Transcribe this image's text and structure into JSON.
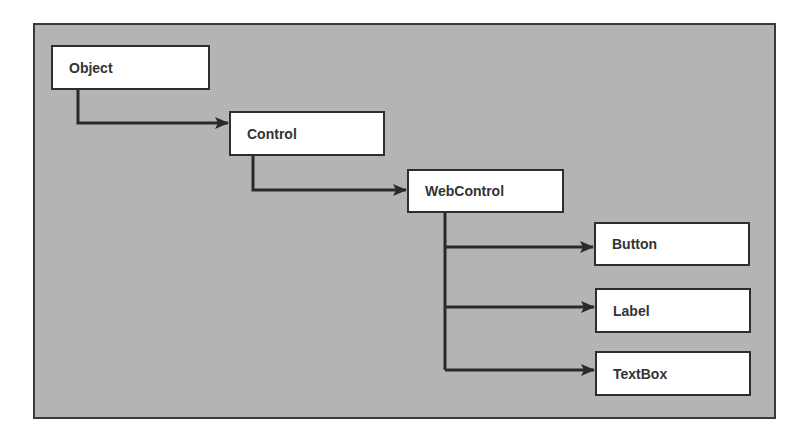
{
  "diagram": {
    "type": "class-hierarchy",
    "background_color": "#b4b4b4",
    "border_color": "#3a3a3a",
    "nodes": [
      {
        "id": "object",
        "label": "Object"
      },
      {
        "id": "control",
        "label": "Control"
      },
      {
        "id": "webcontrol",
        "label": "WebControl"
      },
      {
        "id": "button",
        "label": "Button"
      },
      {
        "id": "label",
        "label": "Label"
      },
      {
        "id": "textbox",
        "label": "TextBox"
      }
    ],
    "edges": [
      {
        "from": "object",
        "to": "control"
      },
      {
        "from": "control",
        "to": "webcontrol"
      },
      {
        "from": "webcontrol",
        "to": "button"
      },
      {
        "from": "webcontrol",
        "to": "label"
      },
      {
        "from": "webcontrol",
        "to": "textbox"
      }
    ]
  }
}
